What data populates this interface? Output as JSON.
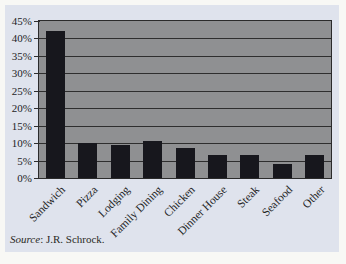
{
  "page": {
    "background_color": "#f8f8f5",
    "panel_color": "#dfe3ed"
  },
  "source_note": {
    "label": "Source",
    "text": ": J.R. Schrock."
  },
  "chart_data": {
    "type": "bar",
    "title": "",
    "xlabel": "",
    "ylabel": "",
    "categories": [
      "Sandwich",
      "Pizza",
      "Lodging",
      "Family Dining",
      "Chicken",
      "Dinner House",
      "Steak",
      "Seafood",
      "Other"
    ],
    "values": [
      42,
      10,
      9.5,
      10.5,
      8.5,
      6.5,
      6.5,
      4,
      6.5
    ],
    "unit": "%",
    "ylim": [
      0,
      45
    ],
    "y_tick_step": 5,
    "y_tick_labels": [
      "0%",
      "5%",
      "10%",
      "15%",
      "20%",
      "25%",
      "30%",
      "35%",
      "40%",
      "45%"
    ],
    "grid": true,
    "legend": "none",
    "bar_color": "#17171d",
    "plot_background": "#8f9092",
    "gridline_color": "#2e2e2e"
  }
}
